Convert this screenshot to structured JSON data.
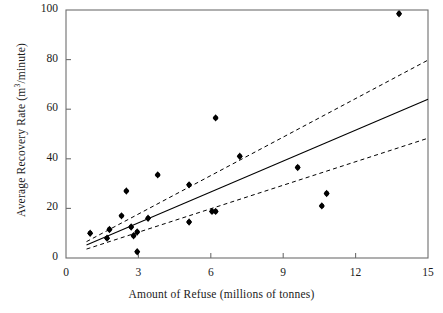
{
  "chart_data": {
    "type": "scatter",
    "title": "",
    "xlabel": "Amount of Refuse (millions of tonnes)",
    "ylabel": "Average Recovery Rate (m3/minute)",
    "ylabel_parts": {
      "pre": "Average Recovery Rate (m",
      "sup": "3",
      "post": "/minute)"
    },
    "xlim": [
      0,
      15
    ],
    "ylim": [
      0,
      100
    ],
    "xticks": [
      0,
      3,
      6,
      9,
      12,
      15
    ],
    "yticks": [
      0,
      20,
      40,
      60,
      80,
      100
    ],
    "xtick_labels": [
      "0",
      "3",
      "6",
      "9",
      "12",
      "15"
    ],
    "ytick_labels": [
      "0",
      "20",
      "40",
      "60",
      "80",
      "100"
    ],
    "grid": false,
    "legend": null,
    "marker": "filled-diamond-circle",
    "marker_color": "#000000",
    "line_color": "#000000",
    "frame": "box",
    "points": [
      {
        "x": 1.0,
        "y": 10.0
      },
      {
        "x": 1.7,
        "y": 8.0
      },
      {
        "x": 1.8,
        "y": 11.5
      },
      {
        "x": 2.3,
        "y": 17.0
      },
      {
        "x": 2.5,
        "y": 27.0
      },
      {
        "x": 2.7,
        "y": 12.5
      },
      {
        "x": 2.8,
        "y": 9.0
      },
      {
        "x": 2.95,
        "y": 10.5
      },
      {
        "x": 2.95,
        "y": 2.5
      },
      {
        "x": 3.4,
        "y": 16.0
      },
      {
        "x": 3.8,
        "y": 33.5
      },
      {
        "x": 5.1,
        "y": 14.5
      },
      {
        "x": 5.1,
        "y": 29.5
      },
      {
        "x": 6.05,
        "y": 18.8
      },
      {
        "x": 6.2,
        "y": 18.8
      },
      {
        "x": 6.2,
        "y": 56.5
      },
      {
        "x": 7.2,
        "y": 41.0
      },
      {
        "x": 9.6,
        "y": 36.5
      },
      {
        "x": 10.6,
        "y": 21.0
      },
      {
        "x": 10.8,
        "y": 26.0
      },
      {
        "x": 13.8,
        "y": 98.5
      }
    ],
    "series": [
      {
        "name": "regression-line",
        "style": "solid",
        "x": [
          0.85,
          15.0
        ],
        "y": [
          5.2,
          64.0
        ]
      },
      {
        "name": "upper-confidence-band",
        "style": "dashed",
        "x": [
          0.85,
          15.0
        ],
        "y": [
          6.6,
          79.8
        ]
      },
      {
        "name": "lower-confidence-band",
        "style": "dashed",
        "x": [
          0.85,
          15.0
        ],
        "y": [
          3.6,
          48.3
        ]
      }
    ]
  }
}
